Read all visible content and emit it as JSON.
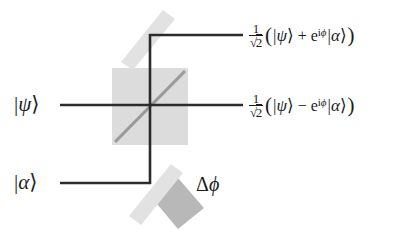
{
  "figure": {
    "type": "optical-interferometer-diagram",
    "background_color": "#ffffff",
    "line_color": "#2b2b2b",
    "beamsplitter_color": "#dcdcdc",
    "mirror_color": "#e2e2e2",
    "mirror_substrate_color": "#b8b8b8",
    "text_color": "#1c1c1c"
  },
  "inputs": [
    {
      "id": "input-psi",
      "ket": "ψ",
      "left_bar": "|",
      "right_angle": "⟩",
      "port": "top-left horizontal port"
    },
    {
      "id": "input-alpha",
      "ket": "α",
      "left_bar": "|",
      "right_angle": "⟩",
      "port": "bottom-left horizontal port"
    }
  ],
  "outputs": [
    {
      "id": "output-plus",
      "prefactor_numerator": "1",
      "prefactor_radical": "√",
      "prefactor_denominator": "2",
      "open_paren": "(",
      "first_ket": "ψ",
      "operator": "+",
      "exponential_base": "e",
      "exponential_superscript_i": "i",
      "exponential_superscript_phi": "ϕ",
      "second_ket": "α",
      "close_paren": ")",
      "bar": "|",
      "angle": "⟩"
    },
    {
      "id": "output-minus",
      "prefactor_numerator": "1",
      "prefactor_radical": "√",
      "prefactor_denominator": "2",
      "open_paren": "(",
      "first_ket": "ψ",
      "operator": "−",
      "exponential_base": "e",
      "exponential_superscript_i": "i",
      "exponential_superscript_phi": "ϕ",
      "second_ket": "α",
      "close_paren": ")",
      "bar": "|",
      "angle": "⟩"
    }
  ],
  "annotations": [
    {
      "id": "phase-shift",
      "delta": "Δ",
      "phi": "ϕ",
      "description": "phase difference applied at the lower mirror"
    }
  ],
  "components": [
    {
      "id": "beam-splitter",
      "label": "",
      "shape": "square-with-diagonal"
    },
    {
      "id": "mirror-top",
      "label": "",
      "shape": "diagonal-bar"
    },
    {
      "id": "mirror-bottom",
      "label": "",
      "shape": "diagonal-bar-with-substrate"
    }
  ]
}
